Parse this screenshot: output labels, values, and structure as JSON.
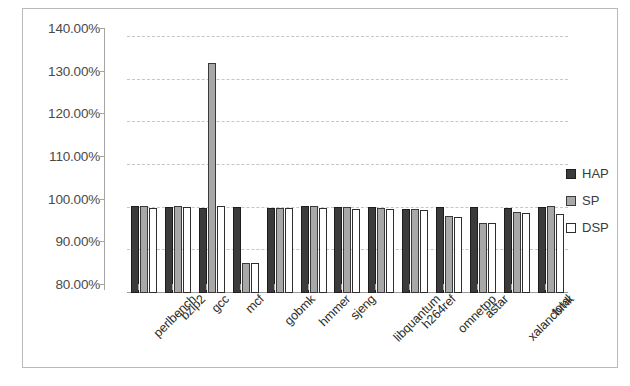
{
  "chart_data": {
    "type": "bar",
    "title": "",
    "subtitle": "",
    "xlabel": "",
    "ylabel": "",
    "ylim": [
      80,
      140
    ],
    "ytick_step": 10,
    "ytick_labels": [
      "140.00%",
      "130.00%",
      "120.00%",
      "110.00%",
      "100.00%",
      "90.00%",
      "80.00%"
    ],
    "ytick_values": [
      140,
      130,
      120,
      110,
      100,
      90,
      80
    ],
    "grid": true,
    "grid_axis": "y",
    "legend_position": "right",
    "value_suffix": "%",
    "categories": [
      "perlbench",
      "bzip2",
      "gcc",
      "mcf",
      "gobmk",
      "hmmer",
      "sjeng",
      "libquantum",
      "h264ref",
      "omnetpp",
      "astar",
      "xalancbmk",
      "total"
    ],
    "series": [
      {
        "name": "HAP",
        "color": "#3b3b3b",
        "values": [
          100.3,
          100.2,
          100.0,
          100.2,
          100.0,
          100.3,
          100.2,
          100.2,
          99.6,
          100.2,
          100.1,
          100.0,
          100.2
        ]
      },
      {
        "name": "SP",
        "color": "#a8a8a8",
        "values": [
          100.4,
          100.4,
          133.8,
          87.0,
          100.0,
          100.3,
          100.1,
          99.9,
          99.8,
          98.1,
          96.5,
          99.0,
          100.5
        ]
      },
      {
        "name": "DSP",
        "color": "#ffffff",
        "values": [
          100.0,
          100.2,
          100.3,
          87.0,
          100.0,
          100.0,
          99.6,
          99.7,
          99.4,
          97.8,
          96.5,
          98.8,
          98.5
        ]
      }
    ]
  },
  "legend": {
    "entries": [
      {
        "label": "HAP",
        "swatch": "hap"
      },
      {
        "label": "SP",
        "swatch": "sp"
      },
      {
        "label": "DSP",
        "swatch": "dsp"
      }
    ]
  }
}
